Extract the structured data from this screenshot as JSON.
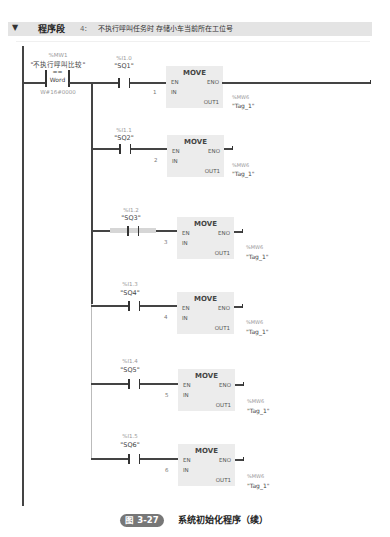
{
  "header": {
    "collapse_icon": "▼",
    "title": "程序段",
    "number": "4：",
    "comment": "不执行呼叫任务时   存储小车当前所在工位号"
  },
  "compare": {
    "address": "%MW1",
    "name": "\"不执行呼叫比较\"",
    "operator": "==",
    "type": "Word",
    "operand": "W#16#0000"
  },
  "rungs": [
    {
      "contact_address": "%I1.0",
      "contact_name": "\"SQ1\"",
      "block": "MOVE",
      "en": "EN",
      "eno": "ENO",
      "in_label": "IN",
      "in_value": "1",
      "out_label": "OUT1",
      "out_address": "%MW6",
      "out_name": "\"Tag_1\""
    },
    {
      "contact_address": "%I1.1",
      "contact_name": "\"SQ2\"",
      "block": "MOVE",
      "en": "EN",
      "eno": "ENO",
      "in_label": "IN",
      "in_value": "2",
      "out_label": "OUT1",
      "out_address": "%MW6",
      "out_name": "\"Tag_1\""
    },
    {
      "contact_address": "%I1.2",
      "contact_name": "\"SQ3\"",
      "block": "MOVE",
      "en": "EN",
      "eno": "ENO",
      "in_label": "IN",
      "in_value": "3",
      "out_label": "OUT1",
      "out_address": "%MW6",
      "out_name": "\"Tag_1\""
    },
    {
      "contact_address": "%I1.3",
      "contact_name": "\"SQ4\"",
      "block": "MOVE",
      "en": "EN",
      "eno": "ENO",
      "in_label": "IN",
      "in_value": "4",
      "out_label": "OUT1",
      "out_address": "%MW6",
      "out_name": "\"Tag_1\""
    },
    {
      "contact_address": "%I1.4",
      "contact_name": "\"SQ5\"",
      "block": "MOVE",
      "en": "EN",
      "eno": "ENO",
      "in_label": "IN",
      "in_value": "5",
      "out_label": "OUT1",
      "out_address": "%MW6",
      "out_name": "\"Tag_1\""
    },
    {
      "contact_address": "%I1.5",
      "contact_name": "\"SQ6\"",
      "block": "MOVE",
      "en": "EN",
      "eno": "ENO",
      "in_label": "IN",
      "in_value": "6",
      "out_label": "OUT1",
      "out_address": "%MW6",
      "out_name": "\"Tag_1\""
    }
  ],
  "caption": {
    "figure_label": "图 3-27",
    "text": "系统初始化程序（续）"
  },
  "colors": {
    "header_bg": "#e4e4e4",
    "block_bg": "#ececec",
    "wire": "#444444",
    "badge_bg": "#777777"
  }
}
